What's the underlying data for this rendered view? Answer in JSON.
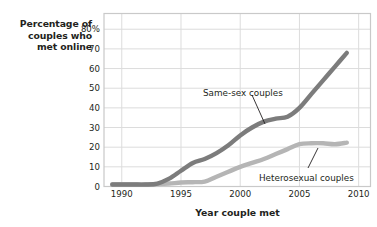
{
  "chart_data": {
    "type": "line",
    "title": "",
    "xlabel": "Year couple met",
    "ylabel": "Percentage of couples who met online",
    "ylabel_lines": [
      "Percentage of",
      "couples who",
      "met online"
    ],
    "xlim": [
      1988.5,
      2011
    ],
    "ylim": [
      0,
      88
    ],
    "grid": true,
    "legend_position": "inline-annotation",
    "xticks": [
      1990,
      1995,
      2000,
      2005,
      2010
    ],
    "xticklabels": [
      "1990",
      "1995",
      "2000",
      "2005",
      "2010"
    ],
    "yticks": [
      0,
      10,
      20,
      30,
      40,
      50,
      60,
      70,
      80
    ],
    "yticklabels": [
      "0",
      "10",
      "20",
      "30",
      "40",
      "50",
      "60",
      "70",
      "80%"
    ],
    "series": [
      {
        "name": "Same-sex couples",
        "color": "#7c7c7c",
        "x": [
          1989.2,
          1990,
          1991,
          1992,
          1993,
          1994,
          1995,
          1996,
          1997,
          1998,
          1999,
          2000,
          2001,
          2002,
          2003,
          2004,
          2005,
          2006,
          2007,
          2008,
          2009
        ],
        "values": [
          1,
          1,
          1,
          1,
          1.5,
          4,
          8,
          12,
          14,
          17,
          21,
          26,
          30,
          33,
          34.5,
          35.5,
          40,
          47,
          54,
          61,
          68
        ]
      },
      {
        "name": "Heterosexual couples",
        "color": "#b5b5b5",
        "x": [
          1989.2,
          1990,
          1991,
          1992,
          1993,
          1994,
          1995,
          1996,
          1997,
          1998,
          1999,
          2000,
          2001,
          2002,
          2003,
          2004,
          2005,
          2006,
          2007,
          2008,
          2009
        ],
        "values": [
          1,
          1,
          1,
          1,
          1.2,
          1.5,
          2,
          2.2,
          2.5,
          5,
          7.5,
          10,
          12,
          14,
          16.5,
          19,
          21.5,
          22,
          22,
          21.5,
          22.3
        ]
      }
    ],
    "annotations": [
      {
        "text": "Same-sex couples",
        "label_x": 203,
        "label_y": 88,
        "leader_from_x": 252,
        "leader_from_y": 95,
        "leader_to_x": 265,
        "leader_to_y": 124
      },
      {
        "text": "Heterosexual couples",
        "label_x": 259,
        "label_y": 173,
        "leader_from_x": 308,
        "leader_from_y": 168,
        "leader_to_x": 318,
        "leader_to_y": 148
      }
    ]
  },
  "axes": {
    "frame_color": "#c9c9c9",
    "grid_color": "#dcdcdc",
    "text_color": "#231f20"
  }
}
